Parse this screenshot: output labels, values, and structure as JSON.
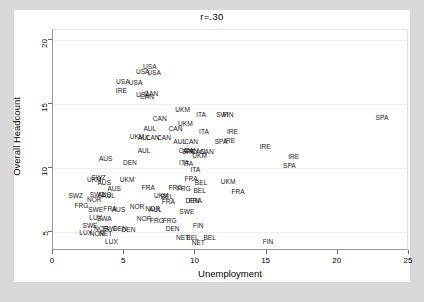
{
  "chart_data": {
    "type": "scatter",
    "title": "r=.30",
    "xlabel": "Unemployment",
    "ylabel": "Overall Headcount",
    "xlim": [
      0,
      25
    ],
    "ylim": [
      3.5,
      20.8
    ],
    "xticks": [
      0,
      5,
      10,
      15,
      20,
      25
    ],
    "yticks": [
      5,
      10,
      15,
      20
    ],
    "grid": true,
    "legend": "none",
    "marker_style": "country-code-text-label",
    "points": [
      {
        "label": "USA",
        "x": 6.8,
        "y": 18.0
      },
      {
        "label": "USA",
        "x": 6.3,
        "y": 17.6
      },
      {
        "label": "USA",
        "x": 7.1,
        "y": 17.5
      },
      {
        "label": "USA",
        "x": 4.9,
        "y": 16.8
      },
      {
        "label": "USA",
        "x": 5.8,
        "y": 16.7
      },
      {
        "label": "IRE",
        "x": 4.8,
        "y": 16.1
      },
      {
        "label": "USA",
        "x": 6.3,
        "y": 15.8
      },
      {
        "label": "CAN",
        "x": 6.9,
        "y": 15.9
      },
      {
        "label": "CAN",
        "x": 6.6,
        "y": 15.6
      },
      {
        "label": "UKM",
        "x": 9.1,
        "y": 14.6
      },
      {
        "label": "ITA",
        "x": 10.4,
        "y": 14.2
      },
      {
        "label": "SWI",
        "x": 11.9,
        "y": 14.2
      },
      {
        "label": "FIN",
        "x": 12.3,
        "y": 14.2
      },
      {
        "label": "SPA",
        "x": 23.1,
        "y": 14.0
      },
      {
        "label": "CAN",
        "x": 7.5,
        "y": 13.9
      },
      {
        "label": "UKM",
        "x": 9.3,
        "y": 13.5
      },
      {
        "label": "AUL",
        "x": 6.8,
        "y": 13.1
      },
      {
        "label": "CAN",
        "x": 8.6,
        "y": 13.1
      },
      {
        "label": "ITA",
        "x": 10.6,
        "y": 12.9
      },
      {
        "label": "IRE",
        "x": 12.6,
        "y": 12.9
      },
      {
        "label": "UKM",
        "x": 5.9,
        "y": 12.5
      },
      {
        "label": "AUL",
        "x": 6.4,
        "y": 12.4
      },
      {
        "label": "CAN",
        "x": 7.0,
        "y": 12.4
      },
      {
        "label": "CAN",
        "x": 7.8,
        "y": 12.4
      },
      {
        "label": "AUL",
        "x": 8.9,
        "y": 12.1
      },
      {
        "label": "CAN",
        "x": 9.7,
        "y": 12.1
      },
      {
        "label": "SPA",
        "x": 11.8,
        "y": 12.1
      },
      {
        "label": "IRE",
        "x": 12.4,
        "y": 12.2
      },
      {
        "label": "IRE",
        "x": 14.9,
        "y": 11.7
      },
      {
        "label": "AUL",
        "x": 6.4,
        "y": 11.4
      },
      {
        "label": "CAN",
        "x": 9.3,
        "y": 11.4
      },
      {
        "label": "CAN",
        "x": 9.7,
        "y": 11.4
      },
      {
        "label": "SPA",
        "x": 9.5,
        "y": 11.3
      },
      {
        "label": "CAN",
        "x": 10.2,
        "y": 11.3
      },
      {
        "label": "CAN",
        "x": 10.8,
        "y": 11.3
      },
      {
        "label": "UKM",
        "x": 10.3,
        "y": 11.0
      },
      {
        "label": "IRE",
        "x": 16.9,
        "y": 10.9
      },
      {
        "label": "AUS",
        "x": 3.7,
        "y": 10.8
      },
      {
        "label": "DEN",
        "x": 5.4,
        "y": 10.5
      },
      {
        "label": "ITA",
        "x": 9.2,
        "y": 10.5
      },
      {
        "label": "ITA",
        "x": 9.5,
        "y": 10.4
      },
      {
        "label": "SPA",
        "x": 16.6,
        "y": 10.2
      },
      {
        "label": "ITA",
        "x": 10.0,
        "y": 9.9
      },
      {
        "label": "SWZ",
        "x": 3.2,
        "y": 9.3
      },
      {
        "label": "UKM",
        "x": 2.9,
        "y": 9.1
      },
      {
        "label": "AUS",
        "x": 3.6,
        "y": 8.9
      },
      {
        "label": "UKM",
        "x": 5.2,
        "y": 9.1
      },
      {
        "label": "FRA",
        "x": 9.7,
        "y": 9.2
      },
      {
        "label": "BEL",
        "x": 10.4,
        "y": 8.9
      },
      {
        "label": "UKM",
        "x": 12.3,
        "y": 9.0
      },
      {
        "label": "AUS",
        "x": 4.3,
        "y": 8.4
      },
      {
        "label": "FRA",
        "x": 6.7,
        "y": 8.5
      },
      {
        "label": "FRG",
        "x": 8.6,
        "y": 8.5
      },
      {
        "label": "FRG",
        "x": 9.2,
        "y": 8.4
      },
      {
        "label": "BEL",
        "x": 10.3,
        "y": 8.3
      },
      {
        "label": "FRA",
        "x": 13.0,
        "y": 8.2
      },
      {
        "label": "SWZ",
        "x": 1.6,
        "y": 7.9
      },
      {
        "label": "SWZ",
        "x": 3.1,
        "y": 8.0
      },
      {
        "label": "AUS",
        "x": 3.6,
        "y": 8.0
      },
      {
        "label": "AUL",
        "x": 3.9,
        "y": 7.9
      },
      {
        "label": "UKM",
        "x": 7.6,
        "y": 7.9
      },
      {
        "label": "BEL",
        "x": 8.0,
        "y": 7.8
      },
      {
        "label": "NOR",
        "x": 2.9,
        "y": 7.6
      },
      {
        "label": "FRA",
        "x": 8.1,
        "y": 7.4
      },
      {
        "label": "DEN",
        "x": 9.8,
        "y": 7.5
      },
      {
        "label": "FRA",
        "x": 10.0,
        "y": 7.5
      },
      {
        "label": "FRG",
        "x": 2.0,
        "y": 7.1
      },
      {
        "label": "SWE",
        "x": 3.0,
        "y": 6.8
      },
      {
        "label": "FRA",
        "x": 4.0,
        "y": 6.9
      },
      {
        "label": "AUS",
        "x": 4.6,
        "y": 6.8
      },
      {
        "label": "NOR",
        "x": 5.9,
        "y": 7.0
      },
      {
        "label": "NOR",
        "x": 7.0,
        "y": 6.9
      },
      {
        "label": "AUL",
        "x": 7.2,
        "y": 6.8
      },
      {
        "label": "SWE",
        "x": 9.4,
        "y": 6.6
      },
      {
        "label": "LUX",
        "x": 3.0,
        "y": 6.2
      },
      {
        "label": "SWA",
        "x": 3.6,
        "y": 6.1
      },
      {
        "label": "NOR",
        "x": 6.4,
        "y": 6.1
      },
      {
        "label": "FRG",
        "x": 7.3,
        "y": 5.9
      },
      {
        "label": "FRG",
        "x": 8.2,
        "y": 5.9
      },
      {
        "label": "SWE",
        "x": 2.6,
        "y": 5.5
      },
      {
        "label": "NOR",
        "x": 3.4,
        "y": 5.3
      },
      {
        "label": "SWE",
        "x": 4.0,
        "y": 5.3
      },
      {
        "label": "DEN",
        "x": 4.7,
        "y": 5.3
      },
      {
        "label": "DEN",
        "x": 5.3,
        "y": 5.2
      },
      {
        "label": "DEN",
        "x": 8.4,
        "y": 5.3
      },
      {
        "label": "FIN",
        "x": 10.2,
        "y": 5.5
      },
      {
        "label": "LUX",
        "x": 2.3,
        "y": 5.0
      },
      {
        "label": "NOR",
        "x": 3.1,
        "y": 4.9
      },
      {
        "label": "NET",
        "x": 3.7,
        "y": 4.9
      },
      {
        "label": "NET",
        "x": 9.1,
        "y": 4.6
      },
      {
        "label": "BEL",
        "x": 9.8,
        "y": 4.6
      },
      {
        "label": "BEL",
        "x": 11.0,
        "y": 4.6
      },
      {
        "label": "LUX",
        "x": 4.1,
        "y": 4.3
      },
      {
        "label": "NET",
        "x": 10.2,
        "y": 4.2
      },
      {
        "label": "FIN",
        "x": 15.1,
        "y": 4.3
      }
    ]
  },
  "colors": {
    "figure_background": "#d8d8d8",
    "canvas_background": "#ffffff",
    "gridline": "#eeeeee",
    "axis": "#6a6a6a",
    "text": "#000000"
  }
}
